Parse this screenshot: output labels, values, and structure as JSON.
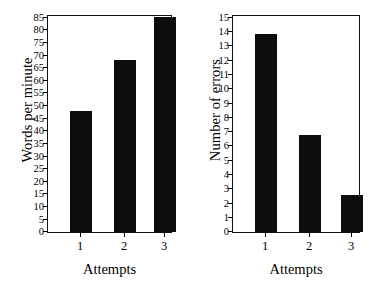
{
  "figure": {
    "background": "#ffffff",
    "bar_color": "#0d0d0d",
    "axis_color": "#111111"
  },
  "chart_data": [
    {
      "id": "words-per-minute",
      "type": "bar",
      "title": "",
      "xlabel": "Attempts",
      "ylabel": "Words per minute",
      "categories": [
        "1",
        "2",
        "3"
      ],
      "values": [
        48,
        68,
        85
      ],
      "ylim": [
        0,
        85
      ],
      "ytick_step": 5,
      "yticks": [
        0,
        5,
        10,
        15,
        20,
        25,
        30,
        35,
        40,
        45,
        50,
        55,
        60,
        65,
        70,
        75,
        80,
        85
      ],
      "grid": false,
      "legend": "none"
    },
    {
      "id": "number-of-errors",
      "type": "bar",
      "title": "",
      "xlabel": "Attempts",
      "ylabel": "Number of errors",
      "categories": [
        "1",
        "2",
        "3"
      ],
      "values": [
        13.8,
        6.8,
        2.6
      ],
      "ylim": [
        0,
        15
      ],
      "ytick_step": 1,
      "yticks": [
        0,
        1,
        2,
        3,
        4,
        5,
        6,
        7,
        8,
        9,
        10,
        11,
        12,
        13,
        14,
        15
      ],
      "grid": false,
      "legend": "none"
    }
  ]
}
